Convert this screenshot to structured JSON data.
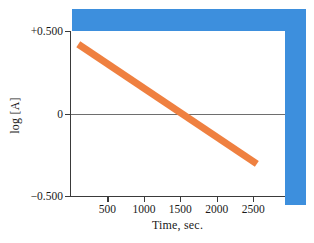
{
  "figure": {
    "background_color": "#ffffff",
    "shadow_color": "#3d8fdd",
    "axis_color": "#3a3a3a",
    "zero_line_color": "#6e6e6e"
  },
  "chart_data": {
    "type": "line",
    "title": "",
    "xlabel": "Time, sec.",
    "ylabel": "log [A]",
    "xlim": [
      0,
      2950
    ],
    "ylim": [
      -0.5,
      0.5
    ],
    "grid": false,
    "legend": null,
    "xticks": [
      500,
      1000,
      1500,
      2000,
      2500
    ],
    "xticklabels": [
      "500",
      "1000",
      "1500",
      "2000",
      "2500"
    ],
    "yticks": [
      0.5,
      0,
      -0.5
    ],
    "yticklabels": [
      "+0.500",
      "0",
      "−0.500"
    ],
    "annotations": [
      {
        "text": "0",
        "note": "horizontal reference line at log [A] = 0"
      }
    ],
    "series": [
      {
        "name": "log [A] vs time",
        "color": "#ef8040",
        "linewidth": 7,
        "x": [
          100,
          2550
        ],
        "y": [
          0.42,
          -0.3
        ],
        "slope_per_sec": -0.000294,
        "intercept": 0.449,
        "zero_crossing_x": 1527
      }
    ]
  }
}
